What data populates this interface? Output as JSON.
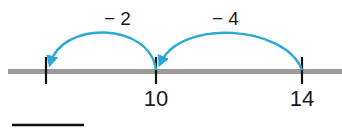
{
  "diagram": {
    "type": "number-line-subtraction",
    "colors": {
      "line": "#9a9a9a",
      "tick": "#111111",
      "arrow": "#2aa8d8",
      "text": "#1a1a1a",
      "answer_blank": "#111111"
    },
    "ticks": [
      {
        "x": 46,
        "label": ""
      },
      {
        "x": 156,
        "label": "10"
      },
      {
        "x": 302,
        "label": "14"
      }
    ],
    "jumps": [
      {
        "from": "14",
        "to": "10",
        "label": "− 4"
      },
      {
        "from": "10",
        "to": "",
        "label": "− 2"
      }
    ],
    "answer_blank": {
      "value": ""
    }
  }
}
